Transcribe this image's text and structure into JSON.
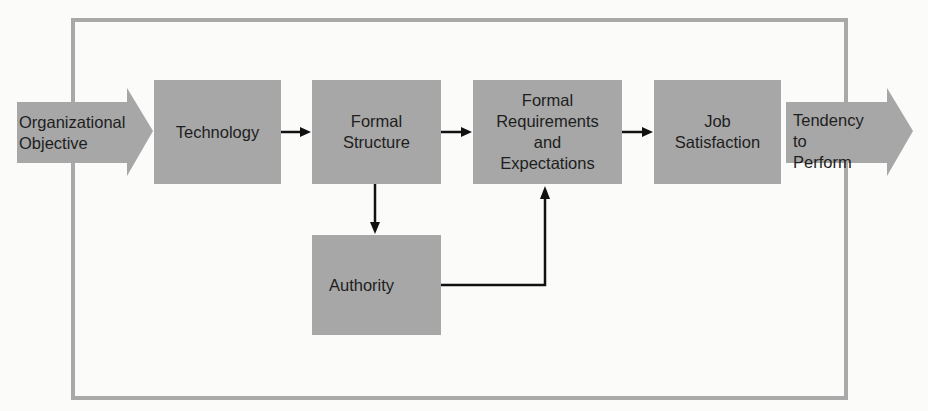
{
  "diagram": {
    "type": "flow",
    "colors": {
      "box_fill": "#a7a7a7",
      "frame": "#a9a9a9",
      "connector": "#111111",
      "text": "#1e1e1e",
      "background": "#fbfbfa"
    },
    "input_arrow": {
      "label": "Organizational\nObjective"
    },
    "output_arrow": {
      "label": "Tendency to\nPerform"
    },
    "nodes": [
      {
        "id": "technology",
        "label": "Technology"
      },
      {
        "id": "formal-structure",
        "label": "Formal\nStructure"
      },
      {
        "id": "formal-requirements",
        "label": "Formal\nRequirements\nand\nExpectations"
      },
      {
        "id": "job-satisfaction",
        "label": "Job\nSatisfaction"
      },
      {
        "id": "authority",
        "label": "Authority"
      }
    ],
    "edges": [
      {
        "from": "Organizational Objective",
        "to": "technology"
      },
      {
        "from": "technology",
        "to": "formal-structure"
      },
      {
        "from": "formal-structure",
        "to": "formal-requirements"
      },
      {
        "from": "formal-requirements",
        "to": "job-satisfaction"
      },
      {
        "from": "job-satisfaction",
        "to": "Tendency to Perform"
      },
      {
        "from": "formal-structure",
        "to": "authority"
      },
      {
        "from": "authority",
        "to": "formal-requirements"
      }
    ]
  }
}
